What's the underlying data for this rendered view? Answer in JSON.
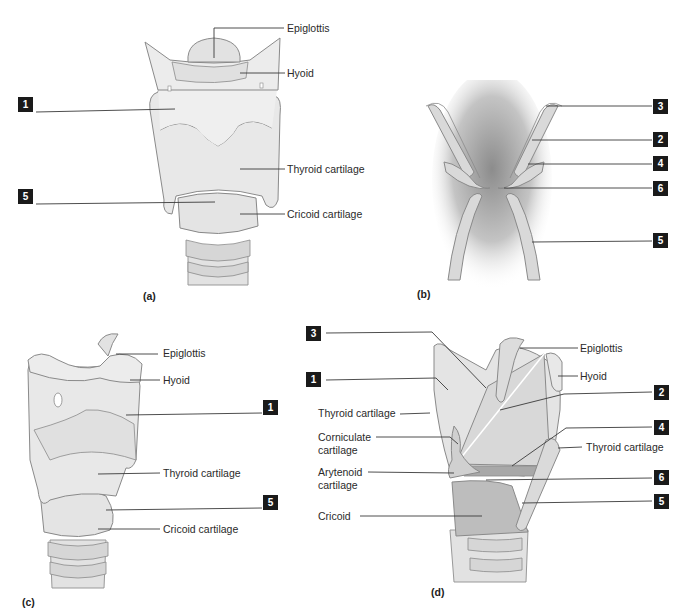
{
  "figure": {
    "colors": {
      "cartilage_fill": "#e6e6e6",
      "cartilage_shade": "#cfcfcf",
      "outline": "#8a8a8a",
      "leader_line": "#3a3a3a",
      "badge_bg": "#1a1a1a",
      "badge_text": "#ffffff",
      "airway_shade": "#9a9a9a"
    },
    "panels": [
      {
        "id": "a",
        "caption": "(a)",
        "view": "anterior",
        "labels": [
          "Epiglottis",
          "Hyoid",
          "Thyroid cartilage",
          "Cricoid cartilage"
        ],
        "badges": [
          "1",
          "5"
        ]
      },
      {
        "id": "b",
        "caption": "(b)",
        "view": "coronal section",
        "labels": [],
        "badges": [
          "3",
          "2",
          "4",
          "6",
          "5"
        ]
      },
      {
        "id": "c",
        "caption": "(c)",
        "view": "lateral",
        "labels": [
          "Epiglottis",
          "Hyoid",
          "Thyroid cartilage",
          "Cricoid cartilage"
        ],
        "badges": [
          "1",
          "5"
        ]
      },
      {
        "id": "d",
        "caption": "(d)",
        "view": "sagittal section",
        "labels": [
          "Epiglottis",
          "Hyoid",
          "Thyroid cartilage",
          "Corniculate cartilage",
          "Thyroid cartilage",
          "Arytenoid cartilage",
          "Cricoid"
        ],
        "badges": [
          "3",
          "1",
          "2",
          "4",
          "6",
          "5"
        ]
      }
    ]
  },
  "a": {
    "caption": "(a)",
    "epiglottis": "Epiglottis",
    "hyoid": "Hyoid",
    "thyroid": "Thyroid cartilage",
    "cricoid": "Cricoid cartilage",
    "badge1": "1",
    "badge5": "5"
  },
  "b": {
    "caption": "(b)",
    "badge3": "3",
    "badge2": "2",
    "badge4": "4",
    "badge6": "6",
    "badge5": "5"
  },
  "c": {
    "caption": "(c)",
    "epiglottis": "Epiglottis",
    "hyoid": "Hyoid",
    "thyroid": "Thyroid cartilage",
    "cricoid": "Cricoid cartilage",
    "badge1": "1",
    "badge5": "5"
  },
  "d": {
    "caption": "(d)",
    "epiglottis": "Epiglottis",
    "hyoid": "Hyoid",
    "thyroid_left": "Thyroid cartilage",
    "corniculate_1": "Corniculate",
    "corniculate_2": "cartilage",
    "thyroid_right": "Thyroid cartilage",
    "arytenoid_1": "Arytenoid",
    "arytenoid_2": "cartilage",
    "cricoid": "Cricoid",
    "badge3": "3",
    "badge1": "1",
    "badge2": "2",
    "badge4": "4",
    "badge6": "6",
    "badge5": "5"
  }
}
